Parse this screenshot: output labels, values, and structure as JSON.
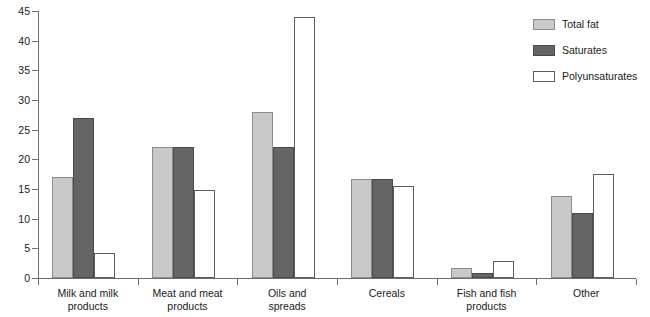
{
  "chart_data": {
    "type": "bar",
    "title": "",
    "subtitle": "",
    "xlabel": "",
    "ylabel": "",
    "ylim": [
      0,
      45
    ],
    "ytick_values": [
      0,
      5,
      10,
      15,
      20,
      25,
      30,
      35,
      40,
      45
    ],
    "ytick_labels": [
      "0",
      "5",
      "10",
      "15",
      "20",
      "25",
      "30",
      "35",
      "40",
      "45"
    ],
    "grid": false,
    "legend_position": "top-right",
    "categories": [
      "Milk and milk products",
      "Meat and meat products",
      "Oils and spreads",
      "Cereals",
      "Fish and fish products",
      "Other"
    ],
    "category_lines": [
      [
        "Milk and milk",
        "products"
      ],
      [
        "Meat and meat",
        "products"
      ],
      [
        "Oils and",
        "spreads"
      ],
      [
        "Cereals"
      ],
      [
        "Fish and fish",
        "products"
      ],
      [
        "Other"
      ]
    ],
    "series": [
      {
        "name": "Total fat",
        "color": "#c9c9c9",
        "values": [
          17,
          22,
          28,
          16.7,
          1.7,
          13.8
        ]
      },
      {
        "name": "Saturates",
        "color": "#656565",
        "values": [
          27,
          22,
          22,
          16.7,
          0.8,
          11
        ]
      },
      {
        "name": "Polyunsaturates",
        "color": "#ffffff",
        "values": [
          4.2,
          14.8,
          44,
          15.5,
          2.9,
          17.6
        ]
      }
    ]
  },
  "legend": {
    "items": [
      {
        "label": "Total fat",
        "swatch": "total-fat"
      },
      {
        "label": "Saturates",
        "swatch": "saturates"
      },
      {
        "label": "Polyunsaturates",
        "swatch": "polyunsaturates"
      }
    ]
  },
  "colors": {
    "total_fat": "#c9c9c9",
    "saturates": "#656565",
    "polyunsaturates": "#ffffff",
    "axis": "#6e6e6e",
    "text": "#1a1a1a",
    "background": "#ffffff"
  }
}
